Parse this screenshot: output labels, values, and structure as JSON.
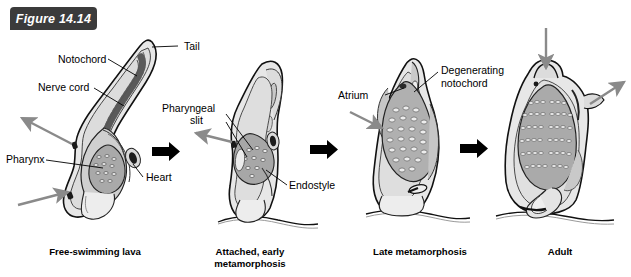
{
  "figure": {
    "badge_label": "Figure 14.14",
    "background_color": "#ffffff",
    "badge_color": "#3b3b3b",
    "ink_color": "#000000",
    "tissue_light": "#e2e2e2",
    "tissue_mid": "#bdbdbd",
    "tissue_dark": "#9a9a9a",
    "flow_arrow_color": "#8a8a8a",
    "transition_arrow_color": "#000000"
  },
  "panels": [
    {
      "id": "panel-larva",
      "caption": "Free-swimming lava",
      "labels": [
        {
          "name": "tail",
          "text": "Tail"
        },
        {
          "name": "notochord",
          "text": "Notochord"
        },
        {
          "name": "nerve-cord",
          "text": "Nerve cord"
        },
        {
          "name": "pharynx",
          "text": "Pharynx"
        },
        {
          "name": "heart",
          "text": "Heart"
        }
      ]
    },
    {
      "id": "panel-attached",
      "caption_line1": "Attached, early",
      "caption_line2": "metamorphosis",
      "labels": [
        {
          "name": "pharyngeal-slit",
          "text_line1": "Pharyngeal",
          "text_line2": "slit"
        },
        {
          "name": "endostyle",
          "text": "Endostyle"
        }
      ]
    },
    {
      "id": "panel-late",
      "caption": "Late metamorphosis",
      "labels": [
        {
          "name": "atrium",
          "text": "Atrium"
        },
        {
          "name": "degenerating-notochord",
          "text_line1": "Degenerating",
          "text_line2": "notochord"
        }
      ]
    },
    {
      "id": "panel-adult",
      "caption": "Adult",
      "labels": []
    }
  ],
  "transition_arrows": [
    {
      "name": "arrow-larva-to-attached"
    },
    {
      "name": "arrow-attached-to-late"
    },
    {
      "name": "arrow-late-to-adult"
    }
  ]
}
